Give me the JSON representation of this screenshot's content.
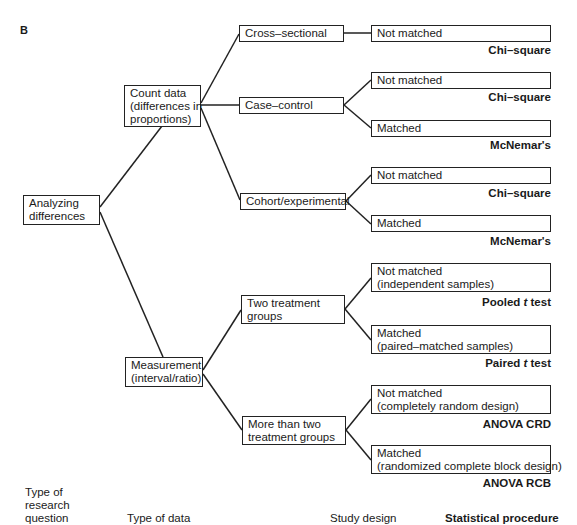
{
  "panel_label": "B",
  "root": {
    "line1": "Analyzing",
    "line2": "differences"
  },
  "data_types": {
    "count": {
      "line1": "Count data",
      "line2": "(differences in",
      "line3": "proportions)"
    },
    "measurement": {
      "line1": "Measurement",
      "line2": "(interval/ratio)"
    }
  },
  "designs": {
    "cross": {
      "line1": "Cross–sectional"
    },
    "case": {
      "line1": "Case–control"
    },
    "cohort": {
      "line1": "Cohort/experimental"
    },
    "two": {
      "line1": "Two treatment",
      "line2": "groups"
    },
    "more": {
      "line1": "More than two",
      "line2": "treatment groups"
    }
  },
  "leaves": [
    {
      "line1": "Not matched",
      "line2": "",
      "procedure": "Chi–square"
    },
    {
      "line1": "Not matched",
      "line2": "",
      "procedure": "Chi–square"
    },
    {
      "line1": "Matched",
      "line2": "",
      "procedure": "McNemar's"
    },
    {
      "line1": "Not matched",
      "line2": "",
      "procedure": "Chi–square"
    },
    {
      "line1": "Matched",
      "line2": "",
      "procedure": "McNemar's"
    },
    {
      "line1": "Not matched",
      "line2": "(independent samples)",
      "procedure_pre": "Pooled ",
      "procedure_italic": "t",
      "procedure_post": " test"
    },
    {
      "line1": "Matched",
      "line2": "(paired–matched samples)",
      "procedure_pre": "Paired ",
      "procedure_italic": "t",
      "procedure_post": " test"
    },
    {
      "line1": "Not matched",
      "line2": "(completely random design)",
      "procedure": "ANOVA CRD"
    },
    {
      "line1": "Matched",
      "line2": "(randomized complete block design)",
      "procedure": "ANOVA RCB"
    }
  ],
  "footer": {
    "col1": {
      "line1": "Type of",
      "line2": "research",
      "line3": "question"
    },
    "col2": "Type of data",
    "col3": "Study design",
    "col4": "Statistical procedure"
  }
}
